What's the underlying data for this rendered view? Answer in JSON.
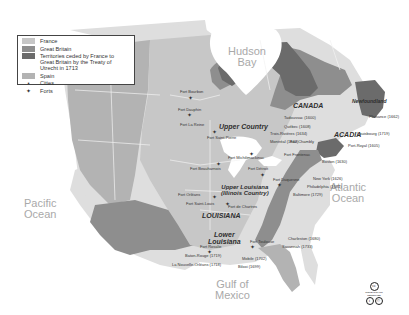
{
  "map": {
    "colors": {
      "france": "#c7c7c7",
      "great_britain": "#8e8e8e",
      "ceded_territories": "#6b6b6b",
      "spain": "#b3b3b3",
      "other_land": "#dedede",
      "water": "#ffffff",
      "border": "#f2f2f2"
    },
    "legend": {
      "items": [
        {
          "label": "France",
          "type": "swatch",
          "color": "#c7c7c7"
        },
        {
          "label": "Great Britain",
          "type": "swatch",
          "color": "#8e8e8e"
        },
        {
          "label": "Territories ceded by France to Great Britain by the Treaty of Utrecht in 1713",
          "type": "swatch",
          "color": "#6b6b6b"
        },
        {
          "label": "Spain",
          "type": "swatch",
          "color": "#b3b3b3"
        },
        {
          "label": "Cities",
          "type": "symbol",
          "symbol": "•"
        },
        {
          "label": "Forts",
          "type": "symbol",
          "symbol": "✦"
        }
      ]
    },
    "water_bodies": [
      {
        "name": "Hudson Bay",
        "line1": "Hudson",
        "line2": "Bay"
      },
      {
        "name": "Pacific Ocean",
        "line1": "Pacific",
        "line2": "Ocean"
      },
      {
        "name": "Atlantic Ocean",
        "line1": "Atlantic",
        "line2": "Ocean"
      },
      {
        "name": "Gulf of Mexico",
        "line1": "Gulf of",
        "line2": "Mexico"
      }
    ],
    "regions": [
      {
        "name": "CANADA",
        "line1": "CANADA",
        "line2": ""
      },
      {
        "name": "ACADIA",
        "line1": "ACADIA",
        "line2": ""
      },
      {
        "name": "Newfoundland",
        "line1": "Newfoundland",
        "line2": ""
      },
      {
        "name": "Upper Country",
        "line1": "Upper Country",
        "line2": ""
      },
      {
        "name": "Upper Louisiana (Illinois Country)",
        "line1": "Upper Louisiana",
        "line2": "(Illinois Country)"
      },
      {
        "name": "LOUISIANA",
        "line1": "LOUISIANA",
        "line2": ""
      },
      {
        "name": "Lower Louisiana",
        "line1": "Lower",
        "line2": "Louisiana"
      }
    ],
    "cities": [
      "Tadoussac (1600)",
      "Québec (1608)",
      "Trois-Rivières (1634)",
      "Montréal (1642)",
      "Plaisance (1662)",
      "Louisbourg (1719)",
      "Port-Royal (1605)",
      "Boston (1630)",
      "New York (1626)",
      "Philadelphia (1681)",
      "Baltimore (1729)",
      "Charleston (1680)",
      "Savannah (1733)",
      "Mobile (1702)",
      "Biloxi (1699)",
      "Baton-Rouge (1719)",
      "La Nouvelle-Orléans (1718)"
    ],
    "forts": [
      "Fort Bourbon",
      "Fort Dauphin",
      "Fort La Reine",
      "Fort Saint-Pierre",
      "Fort Michilimackinac",
      "Fort Beauharnois",
      "Fort Détroit",
      "Fort Frontenac",
      "Fort Chambly",
      "Fort Duquesne",
      "Fort Orléans",
      "Fort Saint-Louis",
      "Fort de Chartres",
      "Fort Rosalie",
      "Fort Toulouse"
    ],
    "license": {
      "badge": "cc",
      "text": "SOME RIGHTS RESERVED",
      "icons": [
        "i",
        "©"
      ]
    }
  }
}
